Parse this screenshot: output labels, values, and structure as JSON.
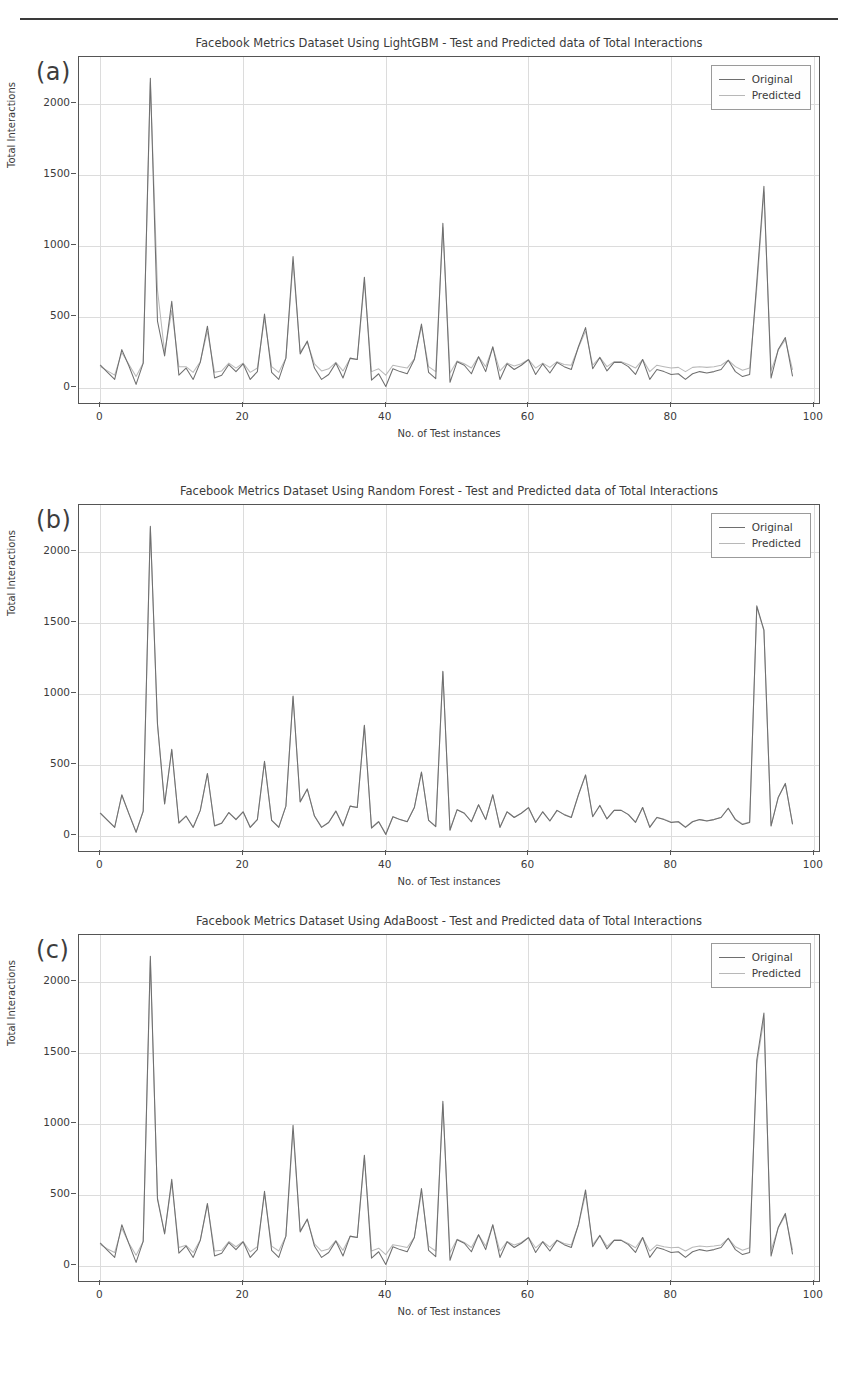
{
  "figure": {
    "panels": [
      {
        "letter": "(a)",
        "title": "Facebook Metrics Dataset Using LightGBM - Test and Predicted data of Total Interactions"
      },
      {
        "letter": "(b)",
        "title": "Facebook Metrics Dataset Using Random Forest - Test and Predicted data of Total Interactions"
      },
      {
        "letter": "(c)",
        "title": "Facebook Metrics Dataset Using AdaBoost - Test and Predicted data of Total Interactions"
      }
    ],
    "legend": {
      "original_label": "Original",
      "predicted_label": "Predicted"
    },
    "axes": {
      "xlabel": "No. of Test instances",
      "ylabel": "Total Interactions",
      "xticks": [
        "0",
        "20",
        "40",
        "60",
        "80",
        "100"
      ],
      "yticks": [
        "0",
        "500",
        "1000",
        "1500",
        "2000"
      ]
    },
    "colors": {
      "original": "#6f6f6f",
      "predicted": "#b9b9b9",
      "grid": "#dcdcdc",
      "axis": "#555555",
      "text": "#3b3b3b"
    }
  },
  "chart_data": [
    {
      "type": "line",
      "panel": "(a)",
      "title": "Facebook Metrics Dataset Using LightGBM - Test and Predicted data of Total Interactions",
      "xlabel": "No. of Test instances",
      "ylabel": "Total Interactions",
      "xlim": [
        -3,
        101
      ],
      "ylim": [
        -120,
        2330
      ],
      "xticks": [
        0,
        20,
        40,
        60,
        80,
        100
      ],
      "yticks": [
        0,
        500,
        1000,
        1500,
        2000
      ],
      "grid": true,
      "legend_position": "upper right",
      "x": [
        0,
        1,
        2,
        3,
        4,
        5,
        6,
        7,
        8,
        9,
        10,
        11,
        12,
        13,
        14,
        15,
        16,
        17,
        18,
        19,
        20,
        21,
        22,
        23,
        24,
        25,
        26,
        27,
        28,
        29,
        30,
        31,
        32,
        33,
        34,
        35,
        36,
        37,
        38,
        39,
        40,
        41,
        42,
        43,
        44,
        45,
        46,
        47,
        48,
        49,
        50,
        51,
        52,
        53,
        54,
        55,
        56,
        57,
        58,
        59,
        60,
        61,
        62,
        63,
        64,
        65,
        66,
        67,
        68,
        69,
        70,
        71,
        72,
        73,
        74,
        75,
        76,
        77,
        78,
        79,
        80,
        81,
        82,
        83,
        84,
        85,
        86,
        87,
        88,
        89,
        90,
        91,
        92,
        93,
        94,
        95,
        96,
        97
      ],
      "series": [
        {
          "name": "Original",
          "values": [
            160,
            110,
            60,
            270,
            155,
            25,
            175,
            2180,
            470,
            225,
            610,
            90,
            140,
            60,
            180,
            435,
            70,
            90,
            165,
            115,
            170,
            60,
            115,
            520,
            110,
            60,
            210,
            925,
            240,
            330,
            140,
            60,
            95,
            175,
            70,
            210,
            200,
            780,
            55,
            100,
            10,
            135,
            115,
            100,
            200,
            450,
            110,
            65,
            1160,
            40,
            185,
            160,
            100,
            220,
            115,
            290,
            60,
            170,
            130,
            160,
            200,
            95,
            170,
            105,
            180,
            150,
            130,
            290,
            425,
            135,
            215,
            120,
            180,
            180,
            150,
            95,
            200,
            60,
            130,
            115,
            95,
            100,
            60,
            100,
            115,
            105,
            115,
            130,
            195,
            115,
            80,
            95,
            745,
            1420,
            70,
            270,
            355,
            85
          ]
        },
        {
          "name": "Predicted",
          "values": [
            150,
            120,
            90,
            250,
            165,
            80,
            175,
            2150,
            690,
            250,
            545,
            150,
            150,
            110,
            185,
            400,
            110,
            120,
            175,
            140,
            175,
            110,
            140,
            490,
            150,
            110,
            210,
            880,
            255,
            320,
            170,
            120,
            135,
            180,
            120,
            205,
            200,
            745,
            115,
            135,
            90,
            160,
            150,
            140,
            205,
            430,
            150,
            115,
            1130,
            105,
            190,
            170,
            140,
            220,
            150,
            285,
            120,
            175,
            155,
            170,
            200,
            140,
            175,
            145,
            185,
            165,
            160,
            285,
            400,
            160,
            215,
            150,
            185,
            185,
            165,
            140,
            200,
            115,
            160,
            150,
            140,
            145,
            115,
            145,
            150,
            145,
            150,
            160,
            195,
            150,
            125,
            140,
            700,
            1380,
            120,
            265,
            340,
            130
          ]
        }
      ]
    },
    {
      "type": "line",
      "panel": "(b)",
      "title": "Facebook Metrics Dataset Using Random Forest - Test and Predicted data of Total Interactions",
      "xlabel": "No. of Test instances",
      "ylabel": "Total Interactions",
      "xlim": [
        -3,
        101
      ],
      "ylim": [
        -120,
        2330
      ],
      "xticks": [
        0,
        20,
        40,
        60,
        80,
        100
      ],
      "yticks": [
        0,
        500,
        1000,
        1500,
        2000
      ],
      "grid": true,
      "legend_position": "upper right",
      "x": [
        0,
        1,
        2,
        3,
        4,
        5,
        6,
        7,
        8,
        9,
        10,
        11,
        12,
        13,
        14,
        15,
        16,
        17,
        18,
        19,
        20,
        21,
        22,
        23,
        24,
        25,
        26,
        27,
        28,
        29,
        30,
        31,
        32,
        33,
        34,
        35,
        36,
        37,
        38,
        39,
        40,
        41,
        42,
        43,
        44,
        45,
        46,
        47,
        48,
        49,
        50,
        51,
        52,
        53,
        54,
        55,
        56,
        57,
        58,
        59,
        60,
        61,
        62,
        63,
        64,
        65,
        66,
        67,
        68,
        69,
        70,
        71,
        72,
        73,
        74,
        75,
        76,
        77,
        78,
        79,
        80,
        81,
        82,
        83,
        84,
        85,
        86,
        87,
        88,
        89,
        90,
        91,
        92,
        93,
        94,
        95,
        96,
        97
      ],
      "series": [
        {
          "name": "Original",
          "values": [
            160,
            110,
            60,
            290,
            155,
            25,
            175,
            2180,
            790,
            225,
            610,
            90,
            140,
            60,
            180,
            440,
            70,
            90,
            165,
            115,
            170,
            60,
            115,
            525,
            110,
            60,
            210,
            985,
            240,
            330,
            140,
            60,
            95,
            175,
            70,
            210,
            200,
            780,
            55,
            100,
            10,
            135,
            115,
            100,
            200,
            450,
            110,
            65,
            1160,
            40,
            185,
            160,
            100,
            220,
            115,
            290,
            60,
            170,
            130,
            160,
            200,
            95,
            170,
            105,
            180,
            150,
            130,
            290,
            430,
            135,
            215,
            120,
            180,
            180,
            150,
            95,
            200,
            60,
            130,
            115,
            95,
            100,
            60,
            100,
            115,
            105,
            115,
            130,
            195,
            115,
            80,
            95,
            1620,
            1450,
            70,
            270,
            370,
            85
          ]
        },
        {
          "name": "Predicted",
          "values": [
            158,
            112,
            62,
            285,
            156,
            30,
            174,
            2170,
            780,
            226,
            605,
            95,
            140,
            63,
            180,
            438,
            74,
            92,
            165,
            118,
            170,
            64,
            116,
            520,
            112,
            64,
            210,
            980,
            241,
            330,
            142,
            64,
            96,
            175,
            74,
            210,
            200,
            775,
            60,
            102,
            16,
            136,
            116,
            102,
            200,
            448,
            112,
            68,
            1155,
            46,
            185,
            161,
            102,
            220,
            116,
            288,
            64,
            170,
            132,
            161,
            200,
            98,
            170,
            107,
            180,
            152,
            132,
            288,
            428,
            137,
            215,
            122,
            180,
            180,
            152,
            98,
            200,
            64,
            132,
            118,
            98,
            102,
            64,
            102,
            116,
            107,
            116,
            132,
            195,
            118,
            84,
            98,
            1610,
            1445,
            74,
            270,
            368,
            88
          ]
        }
      ]
    },
    {
      "type": "line",
      "panel": "(c)",
      "title": "Facebook Metrics Dataset Using AdaBoost - Test and Predicted data of Total Interactions",
      "xlabel": "No. of Test instances",
      "ylabel": "Total Interactions",
      "xlim": [
        -3,
        101
      ],
      "ylim": [
        -120,
        2330
      ],
      "xticks": [
        0,
        20,
        40,
        60,
        80,
        100
      ],
      "yticks": [
        0,
        500,
        1000,
        1500,
        2000
      ],
      "grid": true,
      "legend_position": "upper right",
      "x": [
        0,
        1,
        2,
        3,
        4,
        5,
        6,
        7,
        8,
        9,
        10,
        11,
        12,
        13,
        14,
        15,
        16,
        17,
        18,
        19,
        20,
        21,
        22,
        23,
        24,
        25,
        26,
        27,
        28,
        29,
        30,
        31,
        32,
        33,
        34,
        35,
        36,
        37,
        38,
        39,
        40,
        41,
        42,
        43,
        44,
        45,
        46,
        47,
        48,
        49,
        50,
        51,
        52,
        53,
        54,
        55,
        56,
        57,
        58,
        59,
        60,
        61,
        62,
        63,
        64,
        65,
        66,
        67,
        68,
        69,
        70,
        71,
        72,
        73,
        74,
        75,
        76,
        77,
        78,
        79,
        80,
        81,
        82,
        83,
        84,
        85,
        86,
        87,
        88,
        89,
        90,
        91,
        92,
        93,
        94,
        95,
        96,
        97
      ],
      "series": [
        {
          "name": "Original",
          "values": [
            160,
            110,
            60,
            290,
            155,
            25,
            175,
            2180,
            470,
            225,
            610,
            90,
            140,
            60,
            180,
            440,
            70,
            90,
            165,
            115,
            170,
            60,
            115,
            525,
            110,
            60,
            210,
            990,
            240,
            330,
            140,
            60,
            95,
            175,
            70,
            210,
            200,
            780,
            55,
            100,
            10,
            135,
            115,
            100,
            200,
            545,
            110,
            65,
            1160,
            40,
            185,
            160,
            100,
            220,
            115,
            290,
            60,
            170,
            130,
            160,
            200,
            95,
            170,
            105,
            180,
            150,
            130,
            290,
            535,
            135,
            215,
            120,
            180,
            180,
            150,
            95,
            200,
            60,
            130,
            115,
            95,
            100,
            60,
            100,
            115,
            105,
            115,
            130,
            195,
            115,
            80,
            95,
            1450,
            1780,
            70,
            270,
            370,
            85
          ]
        },
        {
          "name": "Predicted",
          "values": [
            150,
            120,
            95,
            265,
            160,
            75,
            172,
            2150,
            480,
            232,
            585,
            130,
            145,
            95,
            182,
            430,
            105,
            110,
            172,
            135,
            172,
            100,
            135,
            505,
            140,
            105,
            210,
            950,
            248,
            325,
            155,
            105,
            120,
            178,
            110,
            208,
            200,
            760,
            105,
            125,
            80,
            150,
            140,
            130,
            202,
            520,
            140,
            105,
            1140,
            95,
            188,
            165,
            130,
            220,
            140,
            288,
            105,
            172,
            148,
            165,
            200,
            128,
            172,
            132,
            182,
            158,
            148,
            288,
            505,
            150,
            215,
            138,
            182,
            182,
            158,
            128,
            200,
            105,
            148,
            135,
            128,
            132,
            105,
            132,
            140,
            135,
            140,
            148,
            195,
            135,
            110,
            128,
            1420,
            1740,
            110,
            268,
            355,
            115
          ]
        }
      ]
    }
  ]
}
